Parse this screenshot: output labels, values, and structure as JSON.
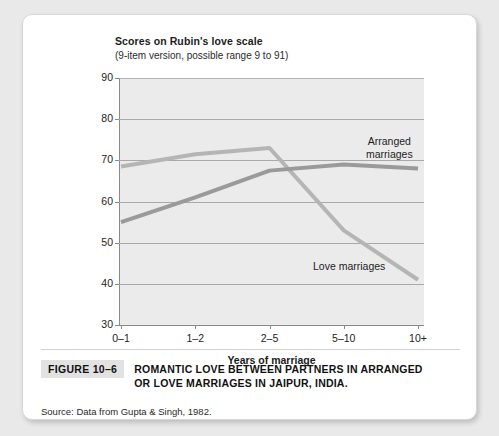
{
  "figure": {
    "badge": "FIGURE 10–6",
    "caption": "ROMANTIC LOVE BETWEEN PARTNERS IN ARRANGED OR LOVE MARRIAGES IN JAIPUR, INDIA.",
    "source": "Source: Data from Gupta & Singh, 1982."
  },
  "chart_data": {
    "type": "line",
    "title": "Scores on Rubin's love scale",
    "subtitle": "(9-item version, possible range 9 to 91)",
    "xlabel": "Years of marriage",
    "ylabel": "",
    "categories": [
      "0–1",
      "1–2",
      "2–5",
      "5–10",
      "10+"
    ],
    "yticks": [
      30,
      40,
      50,
      60,
      70,
      80,
      90
    ],
    "ylim": [
      30,
      90
    ],
    "grid": true,
    "legend_position": "inline-annotation",
    "series": [
      {
        "name": "Arranged marriages",
        "color": "#9a9a9a",
        "values": [
          55,
          61,
          67.5,
          69,
          68
        ],
        "label_x": 343,
        "label_y": 120
      },
      {
        "name": "Love marriages",
        "color": "#b5b5b5",
        "values": [
          68.5,
          71.5,
          73,
          53,
          41
        ],
        "label_x": 290,
        "label_y": 245
      }
    ],
    "annotations": [
      "Arranged marriages",
      "Love marriages"
    ]
  },
  "colors": {
    "plot_background": "#ebebeb",
    "gridline": "#a9a9a9",
    "axis": "#8a8a8a",
    "card": "#ffffff",
    "page_background": "#e9e9e9",
    "badge_background": "#e2e2e2"
  }
}
